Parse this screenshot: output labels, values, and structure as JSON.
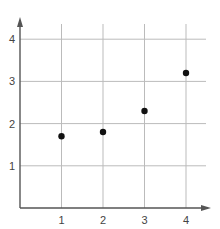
{
  "chart_data": {
    "type": "scatter",
    "title": "",
    "xlabel": "",
    "ylabel": "",
    "x": [
      1,
      2,
      3,
      4
    ],
    "y": [
      1.7,
      1.8,
      2.3,
      3.2
    ],
    "xlim": [
      0,
      4.5
    ],
    "ylim": [
      0,
      4.6
    ],
    "xticks": [
      "1",
      "2",
      "3",
      "4"
    ],
    "yticks": [
      "1",
      "2",
      "3",
      "4"
    ],
    "grid": true,
    "legend": null,
    "colors": {
      "point": "#111111",
      "axis": "#555555",
      "grid": "#bbbbbb",
      "text": "#444444"
    }
  }
}
